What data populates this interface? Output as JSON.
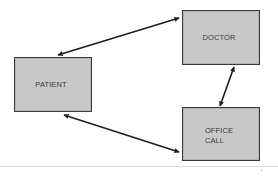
{
  "diagram": {
    "type": "relationship-diagram",
    "nodes": {
      "patient": {
        "label": "PATIENT"
      },
      "doctor": {
        "label": "DOCTOR"
      },
      "office_call": {
        "label": "OFFICE\nCALL"
      }
    },
    "edges": [
      {
        "from": "patient",
        "to": "doctor",
        "direction": "both"
      },
      {
        "from": "doctor",
        "to": "office_call",
        "direction": "both"
      },
      {
        "from": "patient",
        "to": "office_call",
        "direction": "both"
      }
    ],
    "colors": {
      "box_fill": "#c8c8c8",
      "box_border": "#3a3a3a",
      "arrow": "#1e1e1e",
      "background": "#ffffff"
    }
  }
}
